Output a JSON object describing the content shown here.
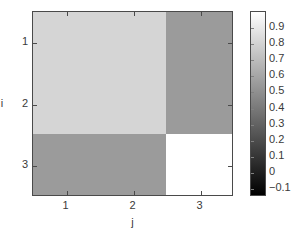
{
  "figure": {
    "background": "#ffffff",
    "axis_color": "#4a4a4a",
    "text_color": "#3a3a3a"
  },
  "chart_data": {
    "type": "heatmap",
    "title": "",
    "xlabel": "j",
    "ylabel": "i",
    "xticklabels": [
      "1",
      "2",
      "3"
    ],
    "yticklabels": [
      "1",
      "2",
      "3"
    ],
    "x": [
      1,
      2,
      3
    ],
    "y": [
      1,
      2,
      3
    ],
    "grid": false,
    "colormap": "gray",
    "clim": [
      -0.15,
      1.0
    ],
    "values": [
      [
        0.8,
        0.8,
        0.5
      ],
      [
        0.8,
        0.8,
        0.5
      ],
      [
        0.5,
        0.5,
        1.0
      ]
    ],
    "cell_colors": [
      [
        "#d5d5d5",
        "#d5d5d5",
        "#9b9b9b"
      ],
      [
        "#d5d5d5",
        "#d5d5d5",
        "#9b9b9b"
      ],
      [
        "#9b9b9b",
        "#9b9b9b",
        "#ffffff"
      ]
    ],
    "colorbar": {
      "position": "right",
      "orientation": "vertical",
      "gradient_top_color": "#ffffff",
      "gradient_bottom_color": "#000000",
      "ticklabels": [
        "0.9",
        "0.8",
        "0.7",
        "0.6",
        "0.5",
        "0.4",
        "0.3",
        "0.2",
        "0.1",
        "0",
        "−0.1"
      ],
      "tickvalues": [
        0.9,
        0.8,
        0.7,
        0.6,
        0.5,
        0.4,
        0.3,
        0.2,
        0.1,
        0,
        -0.1
      ]
    }
  }
}
